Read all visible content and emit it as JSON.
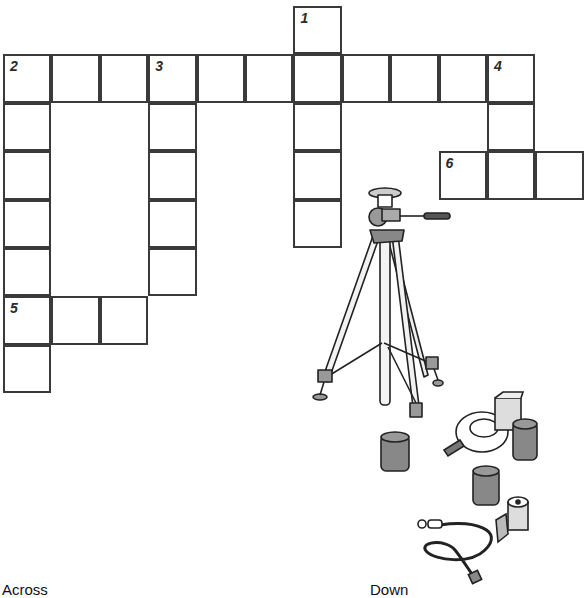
{
  "puzzle": {
    "cell_size": 48.4,
    "origin_x": 3,
    "origin_y": 6,
    "stroke_color": "#3a3a3a",
    "cells": [
      {
        "r": 0,
        "c": 6,
        "num": "1"
      },
      {
        "r": 1,
        "c": 0,
        "num": "2"
      },
      {
        "r": 1,
        "c": 1
      },
      {
        "r": 1,
        "c": 2
      },
      {
        "r": 1,
        "c": 3,
        "num": "3"
      },
      {
        "r": 1,
        "c": 4
      },
      {
        "r": 1,
        "c": 5
      },
      {
        "r": 1,
        "c": 6
      },
      {
        "r": 1,
        "c": 7
      },
      {
        "r": 1,
        "c": 8
      },
      {
        "r": 1,
        "c": 9
      },
      {
        "r": 1,
        "c": 10,
        "num": "4"
      },
      {
        "r": 2,
        "c": 0
      },
      {
        "r": 2,
        "c": 3
      },
      {
        "r": 2,
        "c": 6
      },
      {
        "r": 2,
        "c": 10
      },
      {
        "r": 3,
        "c": 0
      },
      {
        "r": 3,
        "c": 3
      },
      {
        "r": 3,
        "c": 6
      },
      {
        "r": 3,
        "c": 9,
        "num": "6"
      },
      {
        "r": 3,
        "c": 10
      },
      {
        "r": 3,
        "c": 11
      },
      {
        "r": 4,
        "c": 0
      },
      {
        "r": 4,
        "c": 3
      },
      {
        "r": 4,
        "c": 6
      },
      {
        "r": 5,
        "c": 0
      },
      {
        "r": 5,
        "c": 3
      },
      {
        "r": 6,
        "c": 0,
        "num": "5"
      },
      {
        "r": 6,
        "c": 1
      },
      {
        "r": 6,
        "c": 2
      },
      {
        "r": 7,
        "c": 0
      }
    ],
    "entries": {
      "across": [
        {
          "num": "2",
          "length": 11
        },
        {
          "num": "5",
          "length": 3
        },
        {
          "num": "6",
          "length": 3
        }
      ],
      "down": [
        {
          "num": "1",
          "length": 5
        },
        {
          "num": "2",
          "length": 7
        },
        {
          "num": "3",
          "length": 5
        },
        {
          "num": "4",
          "length": 3
        }
      ]
    }
  },
  "clues": {
    "across_heading": "Across",
    "down_heading": "Down"
  },
  "illustrations": [
    {
      "name": "tripod-icon"
    },
    {
      "name": "film-canister-icon"
    },
    {
      "name": "flash-unit-icon"
    },
    {
      "name": "film-box-icon"
    },
    {
      "name": "film-roll-icon"
    },
    {
      "name": "shutter-release-cable-icon"
    }
  ]
}
